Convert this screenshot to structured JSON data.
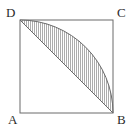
{
  "figure": {
    "type": "geometry-diagram",
    "background_color": "#ffffff",
    "stroke_color": "#6b6b6b",
    "hatch_color": "#8a8a8a",
    "label_color": "#2b2b2b",
    "square": {
      "side_px": 93,
      "corners": {
        "A": {
          "label": "A",
          "x": 20,
          "y": 113,
          "position": "bottom-left"
        },
        "B": {
          "label": "B",
          "x": 113,
          "y": 113,
          "position": "bottom-right"
        },
        "C": {
          "label": "C",
          "x": 113,
          "y": 20,
          "position": "top-right"
        },
        "D": {
          "label": "D",
          "x": 20,
          "y": 20,
          "position": "top-left"
        }
      }
    },
    "arc": {
      "from": "D",
      "to": "B",
      "center": "A",
      "radius_px": 93,
      "sweep": "bulges toward C"
    },
    "chord": {
      "from": "D",
      "to": "B"
    },
    "shaded_region": {
      "name": "circular segment DB",
      "fill": "hatched",
      "bounded_by": [
        "arc D to B",
        "chord D to B"
      ]
    }
  }
}
